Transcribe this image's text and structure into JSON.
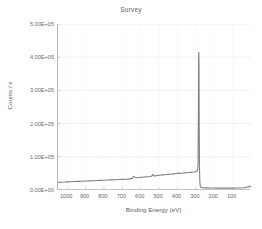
{
  "chart_data": {
    "type": "line",
    "title": "Survey",
    "xlabel": "Binding Energy (eV)",
    "ylabel": "Counts / s",
    "xlim": [
      1050,
      0
    ],
    "ylim": [
      0,
      500000
    ],
    "x_reversed": true,
    "grid": true,
    "legend_position": "none",
    "xticks": [
      1000,
      900,
      800,
      700,
      600,
      500,
      400,
      300,
      200,
      100
    ],
    "xtick_labels": [
      "1000",
      "900",
      "800",
      "700",
      "600",
      "500",
      "400",
      "300",
      "200",
      "100"
    ],
    "yticks": [
      0,
      100000,
      200000,
      300000,
      400000,
      500000
    ],
    "ytick_labels": [
      "0.00E+00",
      "1.00E+05",
      "2.00E+05",
      "3.00E+05",
      "4.00E+05",
      "5.00E+05"
    ],
    "series": [
      {
        "name": "Survey spectrum",
        "color": "#808080",
        "x": [
          1050,
          1030,
          1010,
          1000,
          980,
          960,
          940,
          920,
          900,
          880,
          860,
          840,
          820,
          800,
          780,
          760,
          740,
          720,
          700,
          680,
          660,
          645,
          640,
          630,
          620,
          610,
          600,
          590,
          580,
          570,
          560,
          550,
          545,
          540,
          536,
          533,
          530,
          527,
          524,
          520,
          515,
          510,
          505,
          500,
          490,
          480,
          470,
          460,
          450,
          440,
          430,
          420,
          410,
          405,
          402,
          399,
          396,
          392,
          388,
          384,
          380,
          370,
          360,
          350,
          340,
          330,
          320,
          312,
          306,
          300,
          296,
          292,
          290,
          288,
          286,
          285,
          284,
          283,
          282,
          280,
          278,
          276,
          274,
          272,
          270,
          265,
          260,
          250,
          240,
          220,
          200,
          180,
          160,
          140,
          120,
          100,
          80,
          60,
          40,
          25,
          15,
          5,
          0
        ],
        "y": [
          23000,
          23500,
          24000,
          24500,
          25000,
          25500,
          26000,
          26500,
          27000,
          27500,
          28000,
          28500,
          29000,
          29500,
          30000,
          30500,
          31000,
          31500,
          32000,
          32500,
          33500,
          35000,
          41000,
          38000,
          37000,
          37500,
          38000,
          38500,
          39000,
          39500,
          40000,
          40500,
          41000,
          42000,
          44000,
          47000,
          46000,
          43000,
          42000,
          42500,
          43000,
          43500,
          44000,
          44500,
          45000,
          45500,
          46000,
          46500,
          47000,
          47500,
          48000,
          48500,
          49000,
          49500,
          50500,
          52000,
          51000,
          50000,
          50000,
          50200,
          50500,
          51000,
          51500,
          52000,
          52500,
          53000,
          53500,
          54000,
          54500,
          55000,
          56000,
          58000,
          62000,
          85000,
          240000,
          400000,
          415000,
          380000,
          200000,
          60000,
          22000,
          12000,
          9000,
          8000,
          7500,
          7000,
          6800,
          6500,
          6300,
          6000,
          5800,
          5700,
          5600,
          5500,
          5500,
          5600,
          5800,
          6200,
          7000,
          8000,
          9500,
          11000,
          11500
        ]
      }
    ],
    "annotations": [
      {
        "label": "C 1s",
        "x": 285,
        "y": 415000
      },
      {
        "label": "O 1s",
        "x": 533,
        "y": 47000
      },
      {
        "label": "N 1s",
        "x": 399,
        "y": 52000
      },
      {
        "label": "F/Auger",
        "x": 645,
        "y": 41000
      }
    ]
  }
}
